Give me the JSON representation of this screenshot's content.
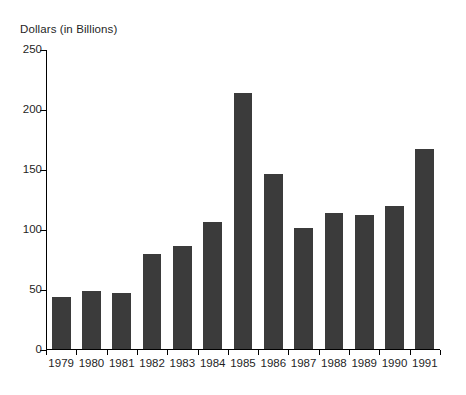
{
  "chart_data": {
    "type": "bar",
    "title": "",
    "xlabel": "",
    "ylabel": "Dollars (in Billions)",
    "categories": [
      "1979",
      "1980",
      "1981",
      "1982",
      "1983",
      "1984",
      "1985",
      "1986",
      "1987",
      "1988",
      "1989",
      "1990",
      "1991"
    ],
    "values": [
      43,
      48,
      47,
      79,
      86,
      106,
      213,
      146,
      101,
      113,
      112,
      119,
      167
    ],
    "ylim": [
      0,
      250
    ],
    "ytick_labels": [
      "0",
      "50",
      "100",
      "150",
      "200",
      "250"
    ],
    "ytick_values": [
      0,
      50,
      100,
      150,
      200,
      250
    ],
    "grid": false,
    "legend": null,
    "bar_color": "#3b3b3b",
    "axis_color": "#000000",
    "background_color": "#ffffff"
  }
}
